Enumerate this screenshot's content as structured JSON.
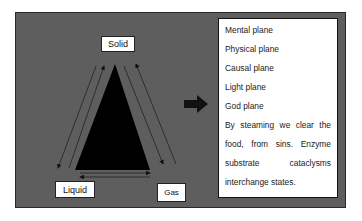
{
  "diagram": {
    "nodes": {
      "top": "Solid",
      "bottom_left": "Liquid",
      "bottom_right": "Gas"
    },
    "planes": [
      "Mental plane",
      "Physical plane",
      "Causal plane",
      "Light plane",
      "God plane"
    ],
    "description_lines": [
      [
        "By",
        "steaming",
        "we",
        "clear",
        "the"
      ],
      [
        "food,",
        "from",
        "sins.",
        "Enzyme"
      ],
      [
        "substrate",
        "cataclysms"
      ],
      [
        "interchange states."
      ]
    ],
    "colors": {
      "frame_background": "#5e5e5e",
      "triangle": "#000000",
      "text_box": "#ffffff",
      "arrow": "#111111"
    }
  }
}
